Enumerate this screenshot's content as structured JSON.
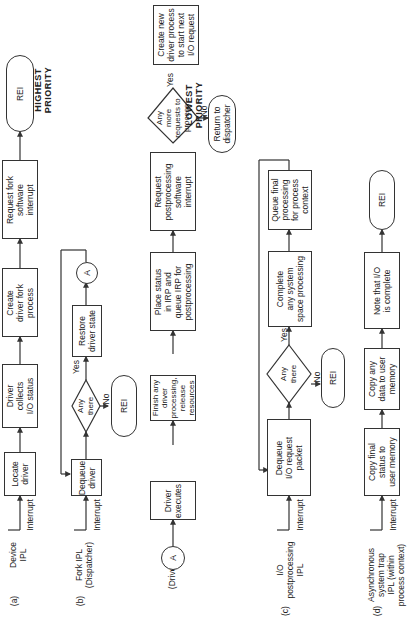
{
  "priority": {
    "highest": "HIGHEST\nPRIORITY",
    "lowest": "LOWEST\nPRIORITY"
  },
  "rows": {
    "a": {
      "tag": "(a)",
      "level": "Device\nIPL",
      "entry": "Interrupt",
      "steps": [
        "Locate\ndriver",
        "Driver\ncollects\nI/O status",
        "Create\ndriver fork\nprocess",
        "Request fork\nsoftware\ninterrupt",
        "REI"
      ]
    },
    "b": {
      "tag": "(b)",
      "level": "Fork IPL\n(Dispatcher)",
      "entry": "Interrupt",
      "steps": [
        "Dequeue\ndriver",
        "Any\nthere",
        "Restore\ndriver state",
        "A"
      ],
      "yes": "Yes",
      "no": "No",
      "no_target": "REI"
    },
    "driver": {
      "level": "(Driver)",
      "connector": "A",
      "steps": [
        "Driver\nexecutes",
        "Finish any\ndriver\nprocessing,\nrelease\nresources",
        "Place status\nin IRP and\nqueue IRP for\npostprocessing",
        "Request\npostprocessing\nsoftware\ninterrupt",
        "Any\nmore\nrequests to\nprocess",
        "Create new\ndriver process\nto start next\nI/O request"
      ],
      "yes": "Yes",
      "no": "No",
      "no_target": "Return to\ndispatcher"
    },
    "c": {
      "tag": "(c)",
      "level": "I/O\npostprocessing\nIPL",
      "entry": "Interrupt",
      "steps": [
        "Dequeue\nI/O request\npacket",
        "Any\nthere",
        "Complete\nany system\nspace processing",
        "Queue final\nprocessing\nfor process\ncontext"
      ],
      "yes": "Yes",
      "no": "No",
      "no_target": "REI"
    },
    "d": {
      "tag": "(d)",
      "level": "Asynchronous\nsystem trap\nIPL (within\nprocess context)",
      "entry": "Interrupt",
      "steps": [
        "Copy final\nstatus to\nuser memory",
        "Copy any\ndata to user\nmemory",
        "Note that I/O\nis complete",
        "REI"
      ]
    }
  }
}
